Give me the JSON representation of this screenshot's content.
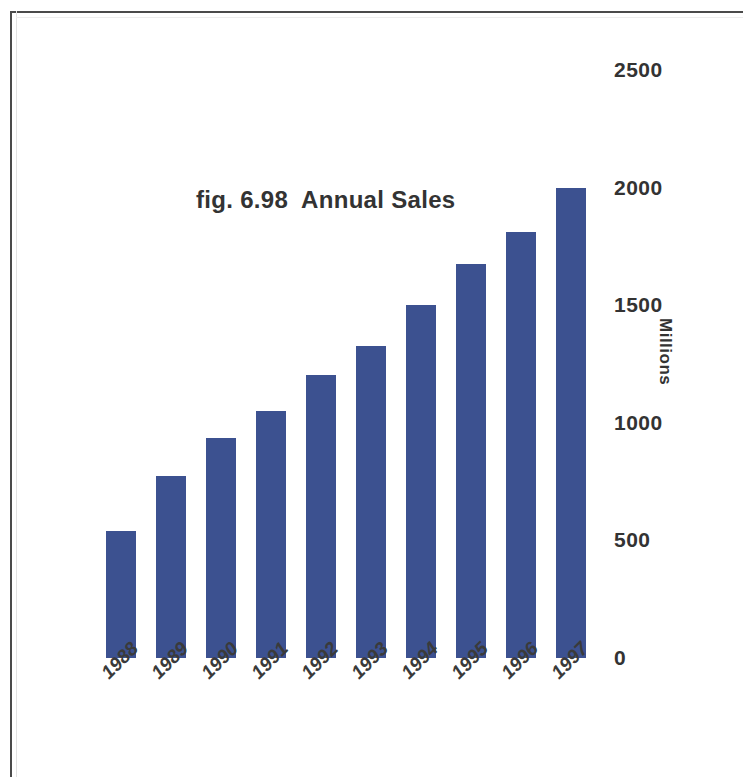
{
  "figure": {
    "title": "fig. 6.98  Annual Sales",
    "border_color": "#4a4a4a",
    "background": "#ffffff"
  },
  "chart_data": {
    "type": "bar",
    "title": "fig. 6.98  Annual Sales",
    "xlabel": "",
    "ylabel": "Millions",
    "categories": [
      "1988",
      "1989",
      "1990",
      "1991",
      "1992",
      "1993",
      "1994",
      "1995",
      "1996",
      "1997"
    ],
    "values": [
      540,
      775,
      935,
      1050,
      1205,
      1325,
      1500,
      1675,
      1810,
      2000
    ],
    "ylim": [
      0,
      2500
    ],
    "yticks": [
      0,
      500,
      1000,
      1500,
      2000,
      2500
    ],
    "ytick_labels": [
      "0",
      "500",
      "1000",
      "1500",
      "2000",
      "2500"
    ],
    "grid": false,
    "legend": false,
    "legend_position": "none",
    "bar_color": "#3c5190",
    "axis_label_color": "#333333",
    "yaxis_side": "right",
    "xtick_rotation": -45
  }
}
